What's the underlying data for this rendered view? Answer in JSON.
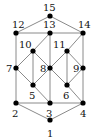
{
  "diagram": {
    "type": "graph",
    "nodes": [
      {
        "id": "1",
        "x": 50,
        "y": 120,
        "lx": 47,
        "ly": 137
      },
      {
        "id": "2",
        "x": 16,
        "y": 103,
        "lx": 12,
        "ly": 117
      },
      {
        "id": "3",
        "x": 50,
        "y": 103,
        "lx": 46,
        "ly": 117
      },
      {
        "id": "4",
        "x": 83,
        "y": 103,
        "lx": 80,
        "ly": 117
      },
      {
        "id": "5",
        "x": 33,
        "y": 85,
        "lx": 29,
        "ly": 99
      },
      {
        "id": "6",
        "x": 67,
        "y": 85,
        "lx": 63,
        "ly": 99
      },
      {
        "id": "7",
        "x": 16,
        "y": 68,
        "lx": 6,
        "ly": 72
      },
      {
        "id": "8",
        "x": 50,
        "y": 68,
        "lx": 40,
        "ly": 72
      },
      {
        "id": "9",
        "x": 83,
        "y": 68,
        "lx": 73,
        "ly": 72
      },
      {
        "id": "10",
        "x": 33,
        "y": 51,
        "lx": 19,
        "ly": 48
      },
      {
        "id": "11",
        "x": 67,
        "y": 51,
        "lx": 53,
        "ly": 48
      },
      {
        "id": "12",
        "x": 16,
        "y": 33,
        "lx": 12,
        "ly": 28
      },
      {
        "id": "13",
        "x": 50,
        "y": 33,
        "lx": 43,
        "ly": 28
      },
      {
        "id": "14",
        "x": 83,
        "y": 33,
        "lx": 78,
        "ly": 28
      },
      {
        "id": "15",
        "x": 50,
        "y": 16,
        "lx": 43,
        "ly": 11
      }
    ],
    "edges": [
      [
        "15",
        "12"
      ],
      [
        "15",
        "14"
      ],
      [
        "12",
        "13"
      ],
      [
        "13",
        "14"
      ],
      [
        "12",
        "7"
      ],
      [
        "14",
        "9"
      ],
      [
        "13",
        "10"
      ],
      [
        "13",
        "8"
      ],
      [
        "14",
        "11"
      ],
      [
        "10",
        "7"
      ],
      [
        "10",
        "8"
      ],
      [
        "10",
        "5"
      ],
      [
        "11",
        "8"
      ],
      [
        "11",
        "9"
      ],
      [
        "11",
        "6"
      ],
      [
        "7",
        "5"
      ],
      [
        "7",
        "2"
      ],
      [
        "8",
        "5"
      ],
      [
        "8",
        "6"
      ],
      [
        "8",
        "3"
      ],
      [
        "9",
        "6"
      ],
      [
        "9",
        "4"
      ],
      [
        "5",
        "3"
      ],
      [
        "6",
        "4"
      ],
      [
        "2",
        "3"
      ],
      [
        "3",
        "4"
      ],
      [
        "2",
        "1"
      ],
      [
        "4",
        "1"
      ]
    ]
  }
}
